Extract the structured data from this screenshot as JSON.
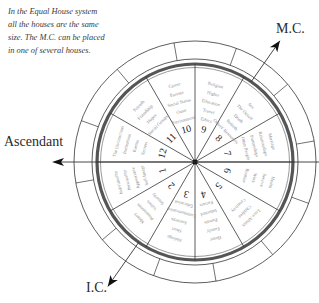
{
  "caption": {
    "lines": [
      "In the Equal House system",
      "all the houses are the same",
      "size. The M.C. can be placed",
      "in one of several houses."
    ]
  },
  "axis_labels": {
    "mc": "M.C.",
    "ic": "I.C.",
    "ascendant": "Ascendant"
  },
  "colors": {
    "line": "#333333",
    "ring": "#555555",
    "house_text": "#8a8a8a",
    "number_text": "#222222"
  },
  "houses": [
    {
      "number": "1",
      "keywords": [
        "Individuality",
        "Personality",
        "Appearance",
        "Self-Image"
      ]
    },
    {
      "number": "2",
      "keywords": [
        "Money",
        "Possessions",
        "Values",
        "Security"
      ]
    },
    {
      "number": "3",
      "keywords": [
        "Siblings",
        "Short",
        "Journeys",
        "Communication",
        "Education"
      ]
    },
    {
      "number": "4",
      "keywords": [
        "Home",
        "Family",
        "Parents",
        "Inherited",
        "Factors"
      ]
    },
    {
      "number": "5",
      "keywords": [
        "Love Affairs",
        "Children",
        "Creativity"
      ]
    },
    {
      "number": "6",
      "keywords": [
        "Health",
        "Service",
        "Work",
        "Routine"
      ]
    },
    {
      "number": "7",
      "keywords": [
        "Marriage",
        "Relationships",
        "Partnerships",
        "Other People"
      ]
    },
    {
      "number": "8",
      "keywords": [
        "Sex",
        "The Occult",
        "Death",
        "Rebirth",
        "Others' Resources"
      ]
    },
    {
      "number": "9",
      "keywords": [
        "Religion",
        "Higher",
        "Education",
        "Travel",
        "Ethics"
      ]
    },
    {
      "number": "10",
      "keywords": [
        "Career",
        "Parents",
        "Social Status",
        "Outer",
        "Environment"
      ]
    },
    {
      "number": "11",
      "keywords": [
        "Friends",
        "Friendship",
        "Hopes",
        "Social Groups"
      ]
    },
    {
      "number": "12",
      "keywords": [
        "The Unconscious",
        "Institutions",
        "Karma",
        "Secrets"
      ]
    }
  ]
}
